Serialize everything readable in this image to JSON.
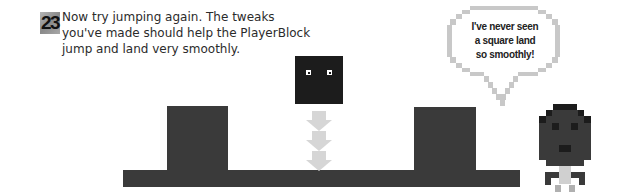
{
  "step": {
    "number": "23",
    "instruction_lines": [
      "Now try jumping again. The tweaks",
      "you've made should help the PlayerBlock",
      "jump and land very smoothly."
    ]
  },
  "speech_bubble": {
    "lines": [
      "I've never seen",
      "a square land",
      "so smoothly!"
    ]
  },
  "scene": {
    "player_block_label": "PlayerBlock",
    "arrow_count": 3,
    "colors": {
      "platform": "#3a3a3a",
      "player_block": "#1c1c1c",
      "arrows": "#d6d6d6",
      "bubble_border": "#c8c8c8",
      "character_head": "#3a3a3a",
      "character_body": "#d0d0d0"
    }
  }
}
